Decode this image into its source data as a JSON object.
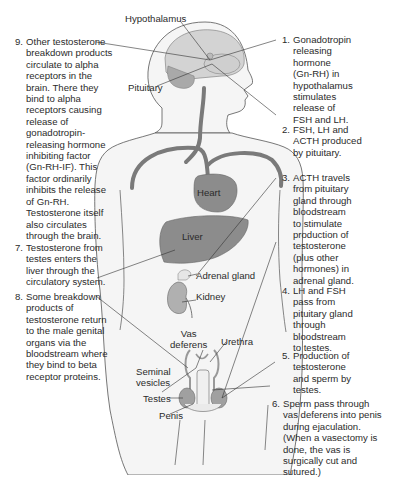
{
  "diagram": {
    "colors": {
      "skin_fill": "#f4f4f4",
      "outline": "#555555",
      "organ_fill": "#8a8a8a",
      "brain_fill": "#cfcfcf",
      "vessel": "#7a7a7a",
      "leader_line": "#333333",
      "text": "#2b2b2b"
    },
    "organ_labels": {
      "hypothalamus": "Hypothalamus",
      "pituitary": "Pituitary",
      "heart": "Heart",
      "liver": "Liver",
      "adrenal_gland": "Adrenal gland",
      "kidney": "Kidney",
      "vas_deferens": "Vas\ndeferens",
      "urethra": "Urethra",
      "seminal_vesicles": "Seminal\nvesicles",
      "testes": "Testes",
      "penis": "Penis"
    },
    "steps": [
      {
        "num": "1.",
        "text": "Gonadotropin\nreleasing\nhormone\n(Gn-RH) in\nhypothalamus\nstimulates\nrelease of\nFSH and LH."
      },
      {
        "num": "2.",
        "text": "FSH, LH and\nACTH produced\nby pituitary."
      },
      {
        "num": "3.",
        "text": "ACTH travels\nfrom pituitary\ngland through\nbloodstream\nto stimulate\nproduction of\ntestosterone\n(plus other\nhormones) in\nadrenal gland."
      },
      {
        "num": "4.",
        "text": "LH and FSH\npass from\npituitary gland\nthrough\nbloodstream\nto testes."
      },
      {
        "num": "5.",
        "text": "Production of\ntestosterone\nand sperm by\ntestes."
      },
      {
        "num": "6.",
        "text": "Sperm pass through\nvas deferens into penis\nduring ejaculation.\n(When a vasectomy is\ndone, the vas is\nsurgically cut and\nsutured.)"
      },
      {
        "num": "7.",
        "text": "Testosterone from\ntestes enters the\nliver through the\ncirculatory system."
      },
      {
        "num": "8.",
        "text": "Some breakdown\nproducts of\ntestosterone return\nto the male genital\norgans via the\nbloodstream where\nthey bind to beta\nreceptor proteins."
      },
      {
        "num": "9.",
        "text": "Other testosterone\nbreakdown products\ncirculate to alpha\nreceptors in the\nbrain. There they\nbind to alpha\nreceptors causing\nrelease of\ngonadotropin-\nreleasing hormone\ninhibiting factor\n(Gn-RH-IF). This\nfactor ordinarily\ninhibits the release\nof Gn-RH.\nTestosterone itself\nalso circulates\nthrough the brain."
      }
    ]
  }
}
